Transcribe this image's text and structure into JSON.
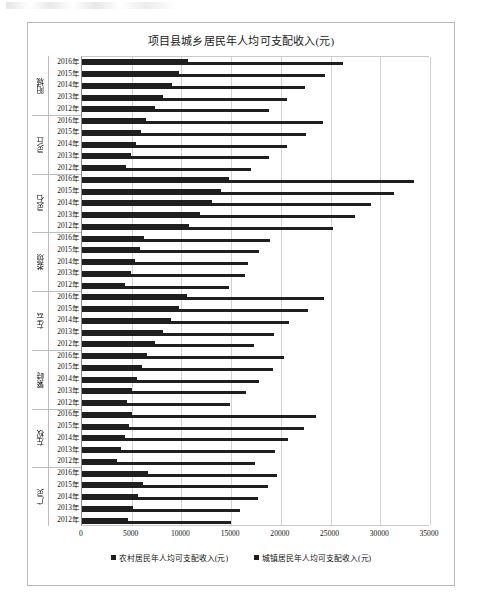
{
  "chart_data": {
    "type": "bar",
    "orientation": "horizontal",
    "title": "项目县城乡居民年人均可支配收入(元)",
    "xlabel": "",
    "ylabel": "",
    "xlim": [
      0,
      35000
    ],
    "xticks": [
      "0",
      "5000",
      "10000",
      "15000",
      "20000",
      "25000",
      "30000",
      "35000"
    ],
    "grid": true,
    "legend_position": "bottom",
    "legend": [
      "农村居民年人均可支配收入(元)",
      "城镇居民年人均可支配收入(元)"
    ],
    "series": [
      {
        "name": "农村居民年人均可支配收入(元)",
        "key": "rural"
      },
      {
        "name": "城镇居民年人均可支配收入(元)",
        "key": "urban"
      }
    ],
    "groups": [
      {
        "name": "阳城",
        "years": [
          "2016年",
          "2015年",
          "2014年",
          "2013年",
          "2012年"
        ],
        "rural": [
          10650,
          9750,
          9100,
          8150,
          7300
        ],
        "urban": [
          26300,
          24400,
          22400,
          20600,
          18800
        ]
      },
      {
        "name": "灵丘",
        "years": [
          "2016年",
          "2015年",
          "2014年",
          "2013年",
          "2012年"
        ],
        "rural": [
          6450,
          5950,
          5450,
          4950,
          4400
        ],
        "urban": [
          24200,
          22500,
          20600,
          18850,
          17000
        ]
      },
      {
        "name": "灵石",
        "years": [
          "2016年",
          "2015年",
          "2014年",
          "2013年",
          "2012年"
        ],
        "rural": [
          14800,
          14000,
          13050,
          11900,
          10800
        ],
        "urban": [
          33350,
          31400,
          29100,
          27500,
          25200
        ]
      },
      {
        "name": "娄烦",
        "years": [
          "2016年",
          "2015年",
          "2014年",
          "2013年",
          "2012年"
        ],
        "rural": [
          6200,
          5800,
          5350,
          4900,
          4350
        ],
        "urban": [
          18900,
          17850,
          16700,
          16400,
          14800
        ]
      },
      {
        "name": "左云",
        "years": [
          "2016年",
          "2015年",
          "2014年",
          "2013年",
          "2012年"
        ],
        "rural": [
          10550,
          9750,
          9000,
          8150,
          7300
        ],
        "urban": [
          24350,
          22700,
          20800,
          19300,
          17300
        ]
      },
      {
        "name": "繁峙",
        "years": [
          "2016年",
          "2015年",
          "2014年",
          "2013年",
          "2012年"
        ],
        "rural": [
          6500,
          6000,
          5550,
          5000,
          4500
        ],
        "urban": [
          20300,
          19200,
          17850,
          16500,
          14850
        ]
      },
      {
        "name": "左权",
        "years": [
          "2016年",
          "2015年",
          "2014年",
          "2013年",
          "2012年"
        ],
        "rural": [
          5050,
          4700,
          4350,
          3900,
          3500
        ],
        "urban": [
          23500,
          22300,
          20700,
          19400,
          17400
        ]
      },
      {
        "name": "广灵",
        "years": [
          "2016年",
          "2015年",
          "2014年",
          "2013年",
          "2012年"
        ],
        "rural": [
          6600,
          6100,
          5650,
          5100,
          4600
        ],
        "urban": [
          19600,
          18700,
          17700,
          15900,
          14950
        ]
      }
    ]
  }
}
